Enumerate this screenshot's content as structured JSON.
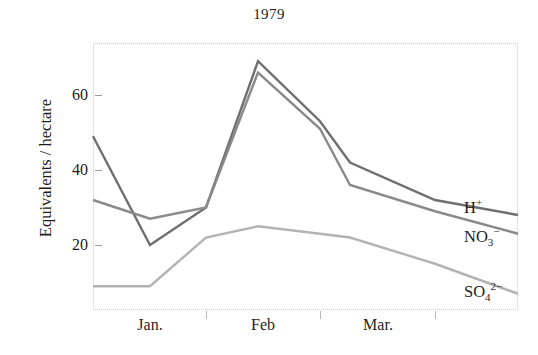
{
  "chart_data": {
    "type": "line",
    "title": "1979",
    "xlabel": "",
    "ylabel": "Equivalents / hectare",
    "ylim": [
      0,
      72
    ],
    "yticks": [
      20,
      40,
      60
    ],
    "ytick_labels": [
      "20",
      "40",
      "60"
    ],
    "grid": false,
    "legend_position": "right-end-of-line",
    "x_tick_labels": [
      "Jan.",
      "Feb",
      "Mar."
    ],
    "x": [
      0,
      1,
      2,
      3,
      4,
      5,
      6,
      7
    ],
    "x_positions_note": "eight sampling vertices spanning Jan. through Mar.",
    "series": [
      {
        "name": "H+",
        "label_html": "H<sup>+</sup>",
        "color": "#6f6f6f",
        "values": [
          49,
          20,
          30,
          69,
          53,
          42,
          32,
          28
        ]
      },
      {
        "name": "NO3-",
        "label_html": "NO<sub>3</sub><sup>−</sup>",
        "color": "#8a8a8a",
        "values": [
          32,
          27,
          30,
          66,
          51,
          36,
          29,
          23
        ]
      },
      {
        "name": "SO4 2-",
        "label_html": "SO<sub>4</sub><sup>2−</sup>",
        "color": "#b3b3b3",
        "values": [
          9,
          9,
          22,
          25,
          23,
          22,
          15,
          7
        ]
      }
    ]
  },
  "axes": {
    "y_ticks": [
      {
        "label": "60",
        "value": 60
      },
      {
        "label": "40",
        "value": 40
      },
      {
        "label": "20",
        "value": 20
      }
    ],
    "x_ticks": [
      {
        "label": "Jan."
      },
      {
        "label": "Feb"
      },
      {
        "label": "Mar."
      }
    ]
  },
  "labels": {
    "h_plus": "H",
    "h_plus_sup": "+",
    "no3_base": "NO",
    "no3_sub": "3",
    "no3_sup": "−",
    "so4_base": "SO",
    "so4_sub": "4",
    "so4_sup": "2−"
  },
  "colors": {
    "h_plus": "#6f6f6f",
    "no3": "#8a8a8a",
    "so4": "#b3b3b3",
    "frame": "#cfcfcf",
    "text": "#1d1d1d"
  }
}
